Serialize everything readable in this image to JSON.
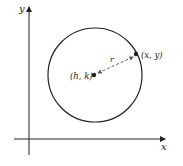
{
  "figure": {
    "axes": {
      "x_label": "x",
      "y_label": "y"
    },
    "center": {
      "label": "(h, k)"
    },
    "point": {
      "label": "(x, y)"
    },
    "radius": {
      "label": "r"
    },
    "colors": {
      "stroke": "#222222",
      "dashed": "#555555",
      "background": "#ffffff"
    }
  }
}
